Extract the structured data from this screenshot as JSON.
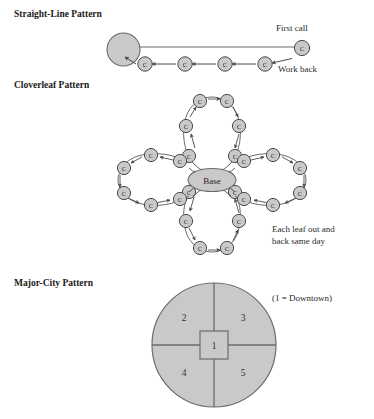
{
  "figure": {
    "title_present": false,
    "background_color": "#ffffff",
    "node_fill": "#c9c9c9",
    "node_stroke": "#4a4a4a",
    "shape_fill": "#c9c9c9",
    "shape_stroke": "#6b6b6b",
    "line_color": "#6b6b6b",
    "text_color": "#1a1a1a"
  },
  "sections": [
    {
      "id": "straight-line",
      "heading": "Straight-Line Pattern",
      "annotations": [
        {
          "id": "first-call",
          "text": "First call"
        },
        {
          "id": "work-back",
          "text": "Work back"
        }
      ],
      "hub_label": "",
      "node_label": "C",
      "node_count": 5,
      "description_flow": "outbound to farthest first call, then work back through calls to base"
    },
    {
      "id": "cloverleaf",
      "heading": "Cloverleaf Pattern",
      "center_label": "Base",
      "node_label": "C",
      "leaf_count": 4,
      "nodes_per_leaf": 6,
      "annotations": [
        {
          "id": "leaf-note",
          "line1": "Each leaf out and",
          "line2": "back same day"
        }
      ]
    },
    {
      "id": "major-city",
      "heading": "Major-City Pattern",
      "annotations": [
        {
          "id": "downtown-key",
          "text": "(1 = Downtown)"
        }
      ],
      "center_zone": "1",
      "quadrants": [
        {
          "id": "upper-left",
          "label": "2"
        },
        {
          "id": "upper-right",
          "label": "3"
        },
        {
          "id": "lower-left",
          "label": "4"
        },
        {
          "id": "lower-right",
          "label": "5"
        }
      ]
    }
  ]
}
